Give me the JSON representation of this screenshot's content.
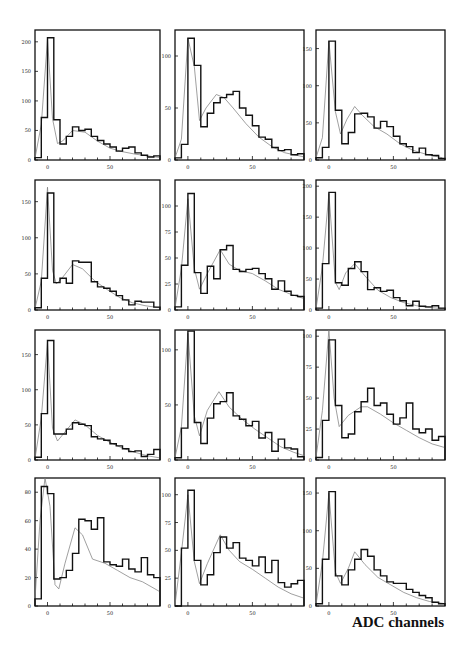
{
  "figure": {
    "xlabel": "ADC channels"
  },
  "chart_data": [
    {
      "type": "bar",
      "panel": 1,
      "title": "",
      "xlabel": "",
      "ylabel": "",
      "xlim": [
        -10,
        90
      ],
      "ylim": [
        0,
        220
      ],
      "yticks": [
        0,
        50,
        100,
        150,
        200
      ],
      "xticks": [
        0,
        50
      ],
      "bin_width": 5,
      "bin_starts": [
        -10,
        -5,
        0,
        5,
        10,
        15,
        20,
        25,
        30,
        35,
        40,
        45,
        50,
        55,
        60,
        65,
        70,
        75,
        80,
        85
      ],
      "values": [
        4,
        72,
        207,
        68,
        27,
        40,
        56,
        50,
        52,
        40,
        33,
        27,
        22,
        15,
        20,
        22,
        12,
        8,
        5,
        7
      ],
      "fit": [
        [
          -10,
          3
        ],
        [
          -5,
          60
        ],
        [
          0,
          205
        ],
        [
          4,
          70
        ],
        [
          8,
          28
        ],
        [
          12,
          32
        ],
        [
          20,
          50
        ],
        [
          30,
          47
        ],
        [
          40,
          32
        ],
        [
          50,
          20
        ],
        [
          60,
          14
        ],
        [
          70,
          10
        ],
        [
          80,
          7
        ],
        [
          90,
          4
        ]
      ]
    },
    {
      "type": "bar",
      "panel": 2,
      "xlim": [
        -10,
        90
      ],
      "ylim": [
        0,
        125
      ],
      "yticks": [
        0,
        50,
        100
      ],
      "xticks": [
        0,
        50
      ],
      "bin_width": 5,
      "bin_starts": [
        -10,
        -5,
        0,
        5,
        10,
        15,
        20,
        25,
        30,
        35,
        40,
        45,
        50,
        55,
        60,
        65,
        70,
        75,
        80,
        85
      ],
      "values": [
        2,
        15,
        117,
        91,
        32,
        45,
        55,
        60,
        63,
        66,
        50,
        43,
        33,
        22,
        20,
        12,
        9,
        10,
        5,
        6
      ],
      "fit": [
        [
          -10,
          2
        ],
        [
          -5,
          20
        ],
        [
          0,
          117
        ],
        [
          5,
          90
        ],
        [
          9,
          38
        ],
        [
          14,
          50
        ],
        [
          22,
          63
        ],
        [
          28,
          60
        ],
        [
          35,
          50
        ],
        [
          45,
          35
        ],
        [
          55,
          22
        ],
        [
          65,
          13
        ],
        [
          75,
          7
        ],
        [
          90,
          3
        ]
      ]
    },
    {
      "type": "bar",
      "panel": 3,
      "xlim": [
        -10,
        90
      ],
      "ylim": [
        0,
        175
      ],
      "yticks": [
        0,
        50,
        100,
        150
      ],
      "xticks": [
        0,
        50
      ],
      "bin_width": 5,
      "bin_starts": [
        -10,
        -5,
        0,
        5,
        10,
        15,
        20,
        25,
        30,
        35,
        40,
        45,
        50,
        55,
        60,
        65,
        70,
        75,
        80,
        85
      ],
      "values": [
        3,
        17,
        160,
        67,
        22,
        37,
        62,
        63,
        58,
        43,
        52,
        45,
        32,
        22,
        18,
        10,
        16,
        7,
        6,
        2
      ],
      "fit": [
        [
          -10,
          3
        ],
        [
          -5,
          30
        ],
        [
          0,
          160
        ],
        [
          5,
          65
        ],
        [
          9,
          35
        ],
        [
          14,
          55
        ],
        [
          20,
          72
        ],
        [
          26,
          60
        ],
        [
          35,
          45
        ],
        [
          45,
          35
        ],
        [
          55,
          22
        ],
        [
          65,
          13
        ],
        [
          75,
          8
        ],
        [
          88,
          3
        ]
      ]
    },
    {
      "type": "bar",
      "panel": 4,
      "xlim": [
        -10,
        90
      ],
      "ylim": [
        0,
        180
      ],
      "yticks": [
        0,
        50,
        100,
        150
      ],
      "xticks": [
        0,
        50
      ],
      "bin_width": 5,
      "bin_starts": [
        -10,
        -5,
        0,
        5,
        10,
        15,
        20,
        25,
        30,
        35,
        40,
        45,
        50,
        55,
        60,
        65,
        70,
        75,
        80,
        85
      ],
      "values": [
        3,
        44,
        162,
        38,
        44,
        37,
        68,
        66,
        66,
        39,
        32,
        30,
        26,
        20,
        14,
        7,
        12,
        11,
        11,
        4
      ],
      "fit": [
        [
          -10,
          2
        ],
        [
          -5,
          40
        ],
        [
          0,
          170
        ],
        [
          4,
          55
        ],
        [
          7,
          36
        ],
        [
          12,
          45
        ],
        [
          20,
          63
        ],
        [
          28,
          57
        ],
        [
          38,
          40
        ],
        [
          48,
          28
        ],
        [
          58,
          17
        ],
        [
          68,
          10
        ],
        [
          78,
          6
        ],
        [
          90,
          3
        ]
      ]
    },
    {
      "type": "bar",
      "panel": 5,
      "xlim": [
        -10,
        90
      ],
      "ylim": [
        0,
        125
      ],
      "yticks": [
        0,
        25,
        50,
        75,
        100
      ],
      "xticks": [
        0,
        50
      ],
      "bin_width": 5,
      "bin_starts": [
        -10,
        -5,
        0,
        5,
        10,
        15,
        20,
        25,
        30,
        35,
        40,
        45,
        50,
        55,
        60,
        65,
        70,
        75,
        80,
        85
      ],
      "values": [
        3,
        43,
        112,
        36,
        16,
        42,
        30,
        58,
        62,
        39,
        37,
        39,
        40,
        35,
        30,
        20,
        28,
        18,
        14,
        13
      ],
      "fit": [
        [
          -10,
          2
        ],
        [
          -5,
          40
        ],
        [
          0,
          107
        ],
        [
          5,
          40
        ],
        [
          9,
          20
        ],
        [
          15,
          35
        ],
        [
          25,
          58
        ],
        [
          32,
          44
        ],
        [
          40,
          38
        ],
        [
          50,
          35
        ],
        [
          60,
          28
        ],
        [
          70,
          20
        ],
        [
          80,
          15
        ],
        [
          90,
          11
        ]
      ]
    },
    {
      "type": "bar",
      "panel": 6,
      "xlim": [
        -10,
        90
      ],
      "ylim": [
        0,
        210
      ],
      "yticks": [
        0,
        50,
        100,
        150,
        200
      ],
      "xticks": [
        0,
        50
      ],
      "bin_width": 5,
      "bin_starts": [
        -10,
        -5,
        0,
        5,
        10,
        15,
        20,
        25,
        30,
        35,
        40,
        45,
        50,
        55,
        60,
        65,
        70,
        75,
        80,
        85
      ],
      "values": [
        3,
        75,
        190,
        44,
        40,
        67,
        78,
        62,
        33,
        36,
        30,
        32,
        20,
        15,
        7,
        14,
        6,
        5,
        7,
        3
      ],
      "fit": [
        [
          -10,
          2
        ],
        [
          -5,
          70
        ],
        [
          0,
          188
        ],
        [
          5,
          45
        ],
        [
          8,
          33
        ],
        [
          13,
          60
        ],
        [
          20,
          75
        ],
        [
          28,
          55
        ],
        [
          38,
          32
        ],
        [
          48,
          20
        ],
        [
          58,
          12
        ],
        [
          68,
          7
        ],
        [
          78,
          4
        ],
        [
          90,
          2
        ]
      ]
    },
    {
      "type": "bar",
      "panel": 7,
      "xlim": [
        -10,
        90
      ],
      "ylim": [
        0,
        185
      ],
      "yticks": [
        0,
        50,
        100,
        150
      ],
      "xticks": [
        0,
        50
      ],
      "bin_width": 5,
      "bin_starts": [
        -10,
        -5,
        0,
        5,
        10,
        15,
        20,
        25,
        30,
        35,
        40,
        45,
        50,
        55,
        60,
        65,
        70,
        75,
        80,
        85
      ],
      "values": [
        4,
        66,
        170,
        37,
        37,
        44,
        53,
        51,
        49,
        33,
        30,
        28,
        23,
        20,
        16,
        12,
        13,
        5,
        8,
        15
      ],
      "fit": [
        [
          -10,
          2
        ],
        [
          -5,
          60
        ],
        [
          0,
          168
        ],
        [
          4,
          45
        ],
        [
          8,
          27
        ],
        [
          14,
          40
        ],
        [
          22,
          57
        ],
        [
          30,
          50
        ],
        [
          40,
          35
        ],
        [
          50,
          25
        ],
        [
          60,
          17
        ],
        [
          70,
          11
        ],
        [
          80,
          6
        ],
        [
          90,
          3
        ]
      ]
    },
    {
      "type": "bar",
      "panel": 8,
      "xlim": [
        -10,
        90
      ],
      "ylim": [
        0,
        118
      ],
      "yticks": [
        0,
        50,
        100
      ],
      "xticks": [
        0,
        50
      ],
      "bin_width": 5,
      "bin_starts": [
        -10,
        -5,
        0,
        5,
        10,
        15,
        20,
        25,
        30,
        35,
        40,
        45,
        50,
        55,
        60,
        65,
        70,
        75,
        80,
        85
      ],
      "values": [
        2,
        29,
        117,
        34,
        15,
        38,
        51,
        53,
        61,
        40,
        37,
        31,
        35,
        20,
        25,
        8,
        19,
        11,
        10,
        3
      ],
      "fit": [
        [
          -10,
          2
        ],
        [
          -5,
          30
        ],
        [
          0,
          115
        ],
        [
          5,
          40
        ],
        [
          9,
          22
        ],
        [
          15,
          45
        ],
        [
          24,
          62
        ],
        [
          32,
          48
        ],
        [
          42,
          37
        ],
        [
          52,
          28
        ],
        [
          62,
          20
        ],
        [
          72,
          12
        ],
        [
          82,
          7
        ],
        [
          90,
          4
        ]
      ]
    },
    {
      "type": "bar",
      "panel": 9,
      "xlim": [
        -10,
        90
      ],
      "ylim": [
        0,
        105
      ],
      "yticks": [
        0,
        25,
        50,
        75,
        100
      ],
      "xticks": [
        0,
        50
      ],
      "bin_width": 5,
      "bin_starts": [
        -10,
        -5,
        0,
        5,
        10,
        15,
        20,
        25,
        30,
        35,
        40,
        45,
        50,
        55,
        60,
        65,
        70,
        75,
        80,
        85
      ],
      "values": [
        2,
        32,
        97,
        44,
        18,
        21,
        39,
        47,
        58,
        44,
        46,
        37,
        29,
        34,
        46,
        25,
        22,
        25,
        16,
        19
      ],
      "fit": [
        [
          -10,
          2
        ],
        [
          -5,
          40
        ],
        [
          0,
          105
        ],
        [
          4,
          50
        ],
        [
          8,
          27
        ],
        [
          15,
          36
        ],
        [
          25,
          43
        ],
        [
          30,
          43
        ],
        [
          40,
          37
        ],
        [
          50,
          30
        ],
        [
          60,
          24
        ],
        [
          70,
          18
        ],
        [
          80,
          13
        ],
        [
          90,
          10
        ]
      ]
    },
    {
      "type": "bar",
      "panel": 10,
      "xlim": [
        -10,
        90
      ],
      "ylim": [
        0,
        90
      ],
      "yticks": [
        0,
        20,
        40,
        60,
        80
      ],
      "xticks": [
        0,
        50
      ],
      "bin_width": 5,
      "bin_starts": [
        -10,
        -5,
        0,
        5,
        10,
        15,
        20,
        25,
        30,
        35,
        40,
        45,
        50,
        55,
        60,
        65,
        70,
        75,
        80,
        85
      ],
      "values": [
        5,
        84,
        79,
        19,
        20,
        25,
        37,
        61,
        60,
        54,
        62,
        31,
        29,
        28,
        33,
        26,
        24,
        34,
        22,
        20
      ],
      "fit": [
        [
          -10,
          5
        ],
        [
          -6,
          60
        ],
        [
          -2,
          92
        ],
        [
          2,
          70
        ],
        [
          6,
          15
        ],
        [
          9,
          12
        ],
        [
          14,
          30
        ],
        [
          22,
          55
        ],
        [
          28,
          50
        ],
        [
          36,
          33
        ],
        [
          46,
          30
        ],
        [
          56,
          25
        ],
        [
          66,
          20
        ],
        [
          76,
          17
        ],
        [
          86,
          12
        ],
        [
          90,
          10
        ]
      ]
    },
    {
      "type": "bar",
      "panel": 11,
      "xlim": [
        -10,
        90
      ],
      "ylim": [
        0,
        115
      ],
      "yticks": [
        0,
        25,
        50,
        75,
        100
      ],
      "xticks": [
        0,
        50
      ],
      "bin_width": 5,
      "bin_starts": [
        -10,
        -5,
        0,
        5,
        10,
        15,
        20,
        25,
        30,
        35,
        40,
        45,
        50,
        55,
        60,
        65,
        70,
        75,
        80,
        85
      ],
      "values": [
        0,
        52,
        104,
        41,
        19,
        28,
        48,
        62,
        52,
        57,
        43,
        41,
        36,
        44,
        30,
        41,
        21,
        17,
        20,
        23
      ],
      "fit": [
        [
          -10,
          1
        ],
        [
          -5,
          48
        ],
        [
          0,
          100
        ],
        [
          5,
          40
        ],
        [
          9,
          20
        ],
        [
          15,
          38
        ],
        [
          25,
          64
        ],
        [
          32,
          50
        ],
        [
          40,
          40
        ],
        [
          50,
          33
        ],
        [
          60,
          25
        ],
        [
          70,
          17
        ],
        [
          80,
          11
        ],
        [
          90,
          7
        ]
      ]
    },
    {
      "type": "bar",
      "panel": 12,
      "xlim": [
        -10,
        90
      ],
      "ylim": [
        0,
        170
      ],
      "yticks": [
        0,
        50,
        100,
        150
      ],
      "xticks": [
        0,
        50
      ],
      "bin_width": 5,
      "bin_starts": [
        -10,
        -5,
        0,
        5,
        10,
        15,
        20,
        25,
        30,
        35,
        40,
        45,
        50,
        55,
        60,
        65,
        70,
        75,
        80,
        85
      ],
      "values": [
        3,
        62,
        152,
        40,
        28,
        48,
        62,
        75,
        66,
        48,
        40,
        32,
        30,
        30,
        22,
        18,
        14,
        11,
        5,
        3
      ],
      "fit": [
        [
          -10,
          2
        ],
        [
          -5,
          58
        ],
        [
          0,
          150
        ],
        [
          5,
          45
        ],
        [
          9,
          30
        ],
        [
          15,
          50
        ],
        [
          20,
          72
        ],
        [
          28,
          55
        ],
        [
          38,
          38
        ],
        [
          48,
          28
        ],
        [
          58,
          18
        ],
        [
          68,
          11
        ],
        [
          78,
          6
        ],
        [
          90,
          3
        ]
      ]
    }
  ]
}
